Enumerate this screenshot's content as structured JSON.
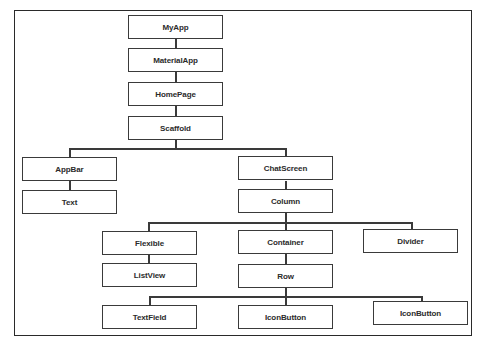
{
  "diagram": {
    "type": "widget-tree",
    "nodes": [
      {
        "id": "myapp",
        "label": "MyApp",
        "parent": null
      },
      {
        "id": "materialapp",
        "label": "MaterialApp",
        "parent": "myapp"
      },
      {
        "id": "homepage",
        "label": "HomePage",
        "parent": "materialapp"
      },
      {
        "id": "scaffold",
        "label": "Scaffold",
        "parent": "homepage"
      },
      {
        "id": "appbar",
        "label": "AppBar",
        "parent": "scaffold"
      },
      {
        "id": "text",
        "label": "Text",
        "parent": "appbar"
      },
      {
        "id": "chatscreen",
        "label": "ChatScreen",
        "parent": "scaffold"
      },
      {
        "id": "column",
        "label": "Column",
        "parent": "chatscreen"
      },
      {
        "id": "flexible",
        "label": "Flexible",
        "parent": "column"
      },
      {
        "id": "listview",
        "label": "ListView",
        "parent": "flexible"
      },
      {
        "id": "container",
        "label": "Container",
        "parent": "column"
      },
      {
        "id": "row",
        "label": "Row",
        "parent": "container"
      },
      {
        "id": "divider",
        "label": "Divider",
        "parent": "column"
      },
      {
        "id": "textfield",
        "label": "TextField",
        "parent": "row"
      },
      {
        "id": "iconbutton1",
        "label": "IconButton",
        "parent": "row"
      },
      {
        "id": "iconbutton2",
        "label": "IconButton",
        "parent": "row"
      }
    ]
  }
}
